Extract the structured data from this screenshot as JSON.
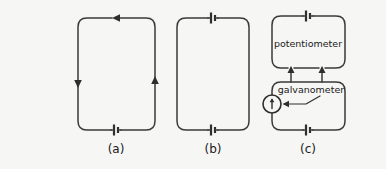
{
  "figure": {
    "background_color": "#f6f6f5",
    "line_color": "#3a3a3a",
    "text_color": "#202020",
    "width": 386,
    "height": 169
  },
  "panels": [
    {
      "id": "a",
      "caption": "(a)",
      "description": "single loop circuit with one battery at bottom and current-direction arrows",
      "loop": {
        "x": 78,
        "y": 18,
        "width": 77,
        "height": 112,
        "radius": 9
      },
      "caption_pos": {
        "x": 116,
        "y": 149
      },
      "batteries": [
        {
          "name": "battery-bottom",
          "x": 116,
          "y": 130,
          "orientation": "vertical-plates"
        }
      ],
      "arrows": [
        {
          "name": "current-arrow-top",
          "x": 116,
          "y": 18,
          "direction": "left"
        },
        {
          "name": "current-arrow-left",
          "x": 78,
          "y": 82,
          "direction": "down"
        },
        {
          "name": "current-arrow-right",
          "x": 155,
          "y": 82,
          "direction": "up"
        }
      ]
    },
    {
      "id": "b",
      "caption": "(b)",
      "description": "single loop circuit with two batteries, one at top and one at bottom, no arrows",
      "loop": {
        "x": 177,
        "y": 18,
        "width": 72,
        "height": 112,
        "radius": 9
      },
      "caption_pos": {
        "x": 213,
        "y": 149
      },
      "batteries": [
        {
          "name": "battery-top",
          "x": 213,
          "y": 18,
          "orientation": "vertical-plates"
        },
        {
          "name": "battery-bottom",
          "x": 213,
          "y": 130,
          "orientation": "vertical-plates"
        }
      ],
      "arrows": []
    },
    {
      "id": "c",
      "caption": "(c)",
      "description": "two coupled loops: an upper potentiometer loop and a lower loop containing a galvanometer",
      "caption_pos": {
        "x": 308,
        "y": 149
      },
      "upper_loop": {
        "x": 272,
        "y": 16,
        "width": 73,
        "height": 52,
        "radius": 9
      },
      "lower_loop": {
        "x": 272,
        "y": 82,
        "width": 73,
        "height": 48,
        "radius": 9
      },
      "connectors": [
        {
          "name": "connector-left",
          "x": 291,
          "y1": 68,
          "y2": 82
        },
        {
          "name": "connector-right",
          "x": 322,
          "y1": 68,
          "y2": 82
        }
      ],
      "batteries": [
        {
          "name": "battery-top",
          "x": 308,
          "y": 16,
          "orientation": "vertical-plates"
        },
        {
          "name": "battery-bottom",
          "x": 308,
          "y": 130,
          "orientation": "vertical-plates"
        }
      ],
      "arrows": [
        {
          "name": "tap-arrow-left",
          "x": 291,
          "y": 70,
          "direction": "up"
        },
        {
          "name": "tap-arrow-right",
          "x": 322,
          "y": 70,
          "direction": "up"
        }
      ],
      "labels": {
        "potentiometer": {
          "text": "potentiometer",
          "x": 308,
          "y": 44
        },
        "galvanometer": {
          "text": "galvanometer",
          "x": 311,
          "y": 90
        }
      },
      "meter": {
        "name": "galvanometer-meter",
        "cx": 272,
        "cy": 104,
        "r": 9,
        "needle_symbol": "up-arrow"
      },
      "leader_line": {
        "name": "galvanometer-leader",
        "points": "320,96 306,104 284,104"
      }
    }
  ]
}
